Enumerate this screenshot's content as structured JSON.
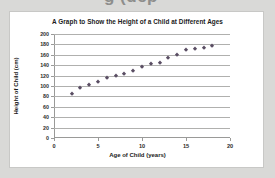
{
  "top_strip": {
    "clipped_text": "g                    (dcp"
  },
  "panel": {
    "background_color": "#ffffff",
    "border_color": "#c8c8c6",
    "page_background_color": "#d9d9d7"
  },
  "chart_data": {
    "type": "scatter",
    "title": "A Graph to Show the Height of a Child at Different Ages",
    "xlabel": "Age of Child (years)",
    "ylabel": "Height of Child (cm)",
    "xlim": [
      0,
      20
    ],
    "ylim": [
      0,
      200
    ],
    "xticks": [
      0,
      5,
      10,
      15,
      20
    ],
    "yticks": [
      0,
      20,
      40,
      60,
      80,
      100,
      120,
      140,
      160,
      180,
      200
    ],
    "grid": "horizontal",
    "legend": "none",
    "marker": "diamond",
    "marker_color": "#5a4e63",
    "x": [
      2,
      3,
      4,
      5,
      6,
      7,
      8,
      9,
      10,
      11,
      12,
      13,
      14,
      15,
      16,
      17,
      18
    ],
    "y": [
      85,
      96,
      102,
      108,
      115,
      120,
      123,
      129,
      136,
      142,
      145,
      154,
      159,
      169,
      171,
      174,
      177
    ],
    "series": [
      {
        "name": "Height of Child",
        "values": [
          85,
          96,
          102,
          108,
          115,
          120,
          123,
          129,
          136,
          142,
          145,
          154,
          159,
          169,
          171,
          174,
          177
        ]
      }
    ]
  }
}
